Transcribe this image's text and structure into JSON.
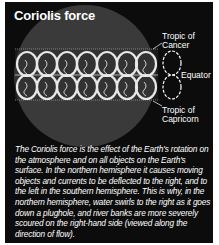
{
  "title": "Coriolis force",
  "labels": {
    "tropic_cancer": "Tropic of Cancer",
    "tropic_cancer_line1": "Tropic of",
    "tropic_cancer_line2": "Cancer",
    "equator": "Equator",
    "tropic_capricorn_line1": "Tropic of",
    "tropic_capricorn_line2": "Capricorn"
  },
  "caption": "The Coriolis force is the effect of the Earth's rotation on the atmosphere and on all objects on the Earth's surface. In the northern hemisphere it causes moving objects and currents to be deflected to the right, and to the left in the southern hemisphere. This is why, in the northern hemisphere, water swirls to the right as it goes down a plughole, and river banks are more severely scoured on the right-hand side (viewed along the direction of flow).",
  "colors": {
    "background": "#0c0c0c",
    "globe": "#3a3a3a",
    "loops": "#e8e8e8",
    "text": "#ffffff"
  }
}
